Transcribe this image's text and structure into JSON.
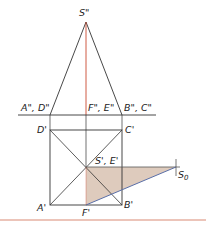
{
  "diagram": {
    "type": "descriptive-geometry-projection",
    "colors": {
      "line": "#333333",
      "axis_red": "#c9472f",
      "shade_fill": "#d8c2b1",
      "trace_blue": "#5a6fa8",
      "bottom_rule": "#d98a74"
    },
    "labels": {
      "apex_front": "S\"",
      "ground_left": "A\", D\"",
      "ground_mid": "F\", E\"",
      "ground_right": "B\", C\"",
      "top_left": "D'",
      "top_right": "C'",
      "center": "S', E'",
      "bottom_left": "A'",
      "bottom_mid": "F'",
      "bottom_right": "B'",
      "shadow_point": "S",
      "shadow_point_sub": "0"
    }
  }
}
